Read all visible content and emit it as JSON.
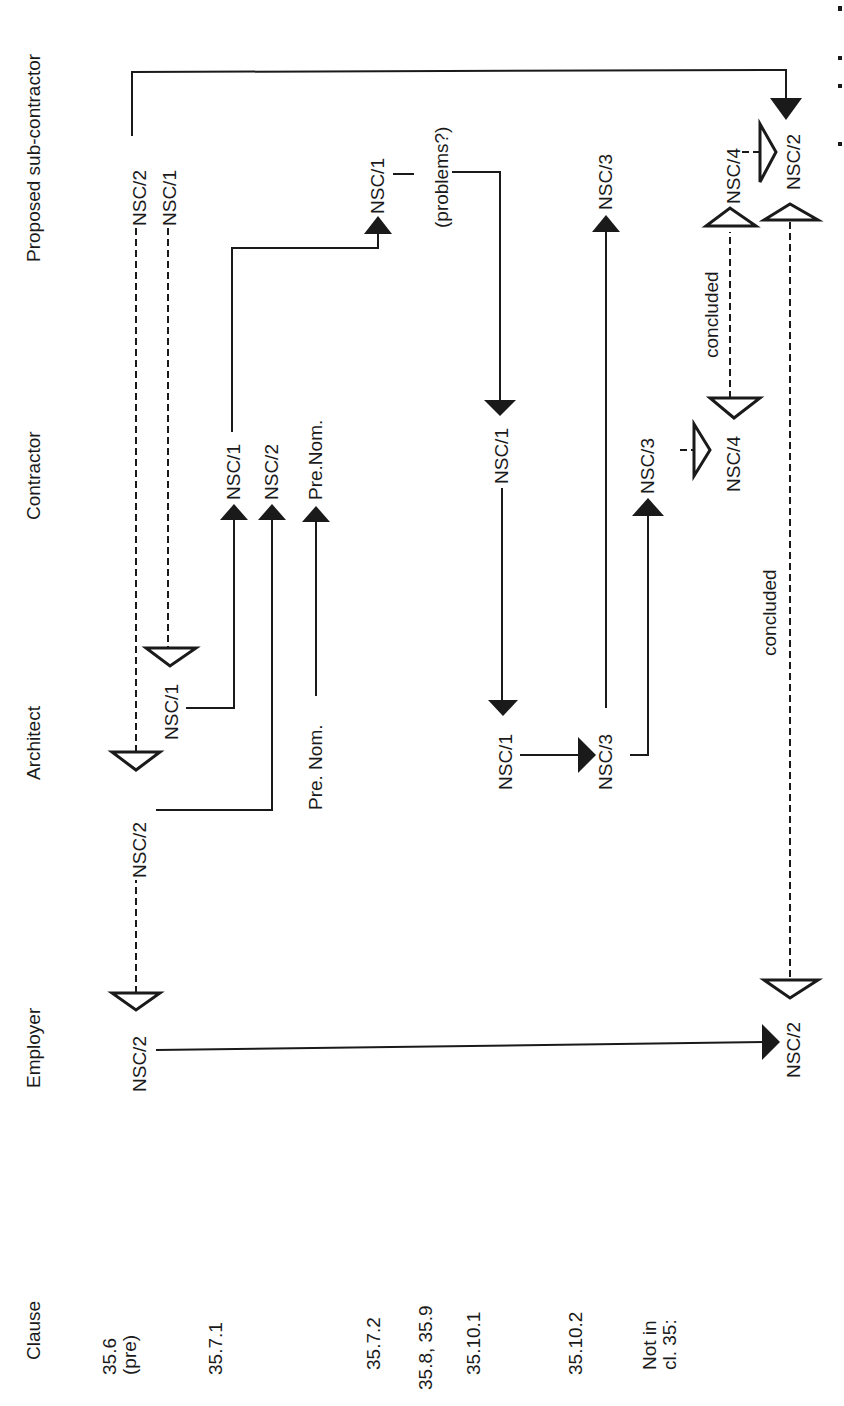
{
  "diagram": {
    "orientation": "rotated 90 degrees counter-clockwise",
    "columns": {
      "clause": "Clause",
      "employer": "Employer",
      "architect": "Architect",
      "contractor": "Contractor",
      "subcontractor": "Proposed sub-contractor"
    },
    "clauses": [
      {
        "id": "c1",
        "label_line1": "35.6",
        "label_line2": "(pre)"
      },
      {
        "id": "c2",
        "label_line1": "35.7.1"
      },
      {
        "id": "c3",
        "label_line1": "35.7.2"
      },
      {
        "id": "c4",
        "label_line1": "35.8, 35.9"
      },
      {
        "id": "c5",
        "label_line1": "35.10.1"
      },
      {
        "id": "c6",
        "label_line1": "35.10.2"
      },
      {
        "id": "c7",
        "label_line1": "Not in",
        "label_line2": "cl. 35:"
      }
    ],
    "labels": {
      "emp_nsc2_a": "NSC/2",
      "arch_nsc2": "NSC/2",
      "arch_nsc1": "NSC/1",
      "sub_nsc2_a": "NSC/2",
      "sub_nsc1_a": "NSC/1",
      "con_nsc1_a": "NSC/1",
      "con_nsc2": "NSC/2",
      "con_prenom": "Pre.Nom.",
      "arch_prenom": "Pre. Nom.",
      "sub_nsc1_b": "NSC/1",
      "problems": "(problems?)",
      "con_nsc1_b": "NSC/1",
      "arch_nsc1_b": "NSC/1",
      "arch_nsc3": "NSC/3",
      "con_nsc3": "NSC/3",
      "sub_nsc3": "NSC/3",
      "con_nsc4": "NSC/4",
      "sub_nsc4": "NSC/4",
      "sub_nsc2_b": "NSC/2",
      "emp_nsc2_b": "NSC/2",
      "concluded_1": "concluded",
      "concluded_2": "concluded"
    },
    "legend": {
      "solid_arrow": "document sent",
      "open_triangle": "document signed / executed",
      "dashed_line": "agreement concluded"
    }
  }
}
